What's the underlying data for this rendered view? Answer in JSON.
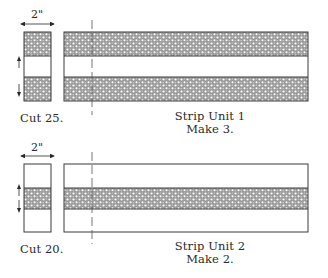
{
  "strip_unit_1": {
    "dimension_label": "2\"",
    "cut_label": "Cut 25.",
    "title": "Strip Unit 1",
    "subtitle": "Make 3.",
    "bands": [
      "fabric",
      "background",
      "fabric"
    ]
  },
  "strip_unit_2": {
    "dimension_label": "2\"",
    "cut_label": "Cut 20.",
    "title": "Strip Unit 2",
    "subtitle": "Make 2.",
    "bands": [
      "background",
      "fabric",
      "background"
    ]
  },
  "colors": {
    "outline": "#3a3a3a",
    "fabric_base": "#9a9a9a",
    "fabric_dots": "#ffffff",
    "background": "#ffffff"
  }
}
